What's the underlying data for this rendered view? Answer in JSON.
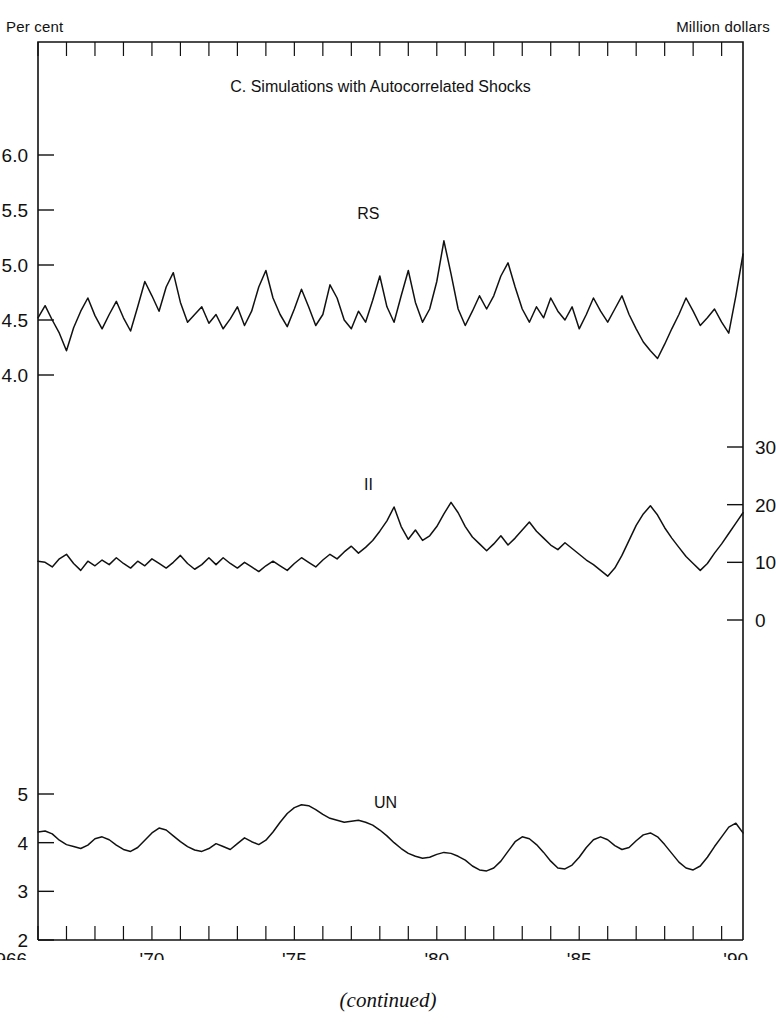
{
  "figure": {
    "left_axis_caption": "Per cent",
    "right_axis_caption": "Million dollars",
    "bottom_caption": "(continued)",
    "title": "C.  Simulations with Autocorrelated Shocks"
  },
  "chart_data": {
    "type": "line",
    "title": "C.  Simulations with Autocorrelated Shocks",
    "xlabel": "",
    "ylabel": "Per cent",
    "ylabel_right": "Million dollars",
    "grid": false,
    "legend_position": "inline-annotations",
    "xlim": [
      1966,
      1990.75
    ],
    "x_tick_labels": [
      "1966",
      "'70",
      "'75",
      "'80",
      "'85",
      "'90"
    ],
    "x_tick_values": [
      1966,
      1970,
      1975,
      1980,
      1985,
      1990
    ],
    "x_minor_tick_interval": 1,
    "line_color": "#111111",
    "frame_color": "#111111",
    "panels": [
      {
        "name": "RS",
        "label": "RS",
        "axis": "left",
        "units": "Per cent",
        "y_tick_labels": [
          "6.0",
          "5.5",
          "5.0",
          "4.5",
          "4.0"
        ],
        "y_tick_values": [
          6.0,
          5.5,
          5.0,
          4.5,
          4.0
        ],
        "ylim": [
          3.85,
          6.55
        ],
        "label_x": 1977.6,
        "label_y": 5.42,
        "x": [
          1966.0,
          1966.25,
          1966.5,
          1966.75,
          1967.0,
          1967.25,
          1967.5,
          1967.75,
          1968.0,
          1968.25,
          1968.5,
          1968.75,
          1969.0,
          1969.25,
          1969.5,
          1969.75,
          1970.0,
          1970.25,
          1970.5,
          1970.75,
          1971.0,
          1971.25,
          1971.5,
          1971.75,
          1972.0,
          1972.25,
          1972.5,
          1972.75,
          1973.0,
          1973.25,
          1973.5,
          1973.75,
          1974.0,
          1974.25,
          1974.5,
          1974.75,
          1975.0,
          1975.25,
          1975.5,
          1975.75,
          1976.0,
          1976.25,
          1976.5,
          1976.75,
          1977.0,
          1977.25,
          1977.5,
          1977.75,
          1978.0,
          1978.25,
          1978.5,
          1978.75,
          1979.0,
          1979.25,
          1979.5,
          1979.75,
          1980.0,
          1980.25,
          1980.5,
          1980.75,
          1981.0,
          1981.25,
          1981.5,
          1981.75,
          1982.0,
          1982.25,
          1982.5,
          1982.75,
          1983.0,
          1983.25,
          1983.5,
          1983.75,
          1984.0,
          1984.25,
          1984.5,
          1984.75,
          1985.0,
          1985.25,
          1985.5,
          1985.75,
          1986.0,
          1986.25,
          1986.5,
          1986.75,
          1987.0,
          1987.25,
          1987.5,
          1987.75,
          1988.0,
          1988.25,
          1988.5,
          1988.75,
          1989.0,
          1989.25,
          1989.5,
          1989.75,
          1990.0,
          1990.25,
          1990.5,
          1990.75
        ],
        "y": [
          4.52,
          4.63,
          4.5,
          4.38,
          4.22,
          4.43,
          4.58,
          4.7,
          4.54,
          4.42,
          4.55,
          4.67,
          4.52,
          4.4,
          4.62,
          4.85,
          4.72,
          4.58,
          4.8,
          4.93,
          4.66,
          4.48,
          4.55,
          4.62,
          4.47,
          4.55,
          4.42,
          4.51,
          4.62,
          4.45,
          4.58,
          4.8,
          4.95,
          4.7,
          4.55,
          4.44,
          4.6,
          4.78,
          4.62,
          4.45,
          4.55,
          4.82,
          4.7,
          4.5,
          4.42,
          4.58,
          4.48,
          4.68,
          4.9,
          4.62,
          4.48,
          4.72,
          4.95,
          4.66,
          4.48,
          4.6,
          4.85,
          5.22,
          4.92,
          4.6,
          4.45,
          4.58,
          4.72,
          4.6,
          4.72,
          4.9,
          5.02,
          4.8,
          4.6,
          4.48,
          4.62,
          4.52,
          4.7,
          4.58,
          4.5,
          4.62,
          4.42,
          4.55,
          4.7,
          4.58,
          4.48,
          4.6,
          4.72,
          4.55,
          4.42,
          4.3,
          4.22,
          4.15,
          4.28,
          4.42,
          4.55,
          4.7,
          4.58,
          4.45,
          4.52,
          4.6,
          4.48,
          4.38,
          4.72,
          5.1
        ]
      },
      {
        "name": "II",
        "label": "II",
        "axis": "right",
        "units": "Million dollars",
        "y_tick_labels": [
          "30",
          "20",
          "10",
          "0"
        ],
        "y_tick_values": [
          30,
          20,
          10,
          0
        ],
        "ylim": [
          -2,
          35
        ],
        "label_x": 1977.6,
        "label_y": 22.5,
        "x": [
          1966.0,
          1966.25,
          1966.5,
          1966.75,
          1967.0,
          1967.25,
          1967.5,
          1967.75,
          1968.0,
          1968.25,
          1968.5,
          1968.75,
          1969.0,
          1969.25,
          1969.5,
          1969.75,
          1970.0,
          1970.25,
          1970.5,
          1970.75,
          1971.0,
          1971.25,
          1971.5,
          1971.75,
          1972.0,
          1972.25,
          1972.5,
          1972.75,
          1973.0,
          1973.25,
          1973.5,
          1973.75,
          1974.0,
          1974.25,
          1974.5,
          1974.75,
          1975.0,
          1975.25,
          1975.5,
          1975.75,
          1976.0,
          1976.25,
          1976.5,
          1976.75,
          1977.0,
          1977.25,
          1977.5,
          1977.75,
          1978.0,
          1978.25,
          1978.5,
          1978.75,
          1979.0,
          1979.25,
          1979.5,
          1979.75,
          1980.0,
          1980.25,
          1980.5,
          1980.75,
          1981.0,
          1981.25,
          1981.5,
          1981.75,
          1982.0,
          1982.25,
          1982.5,
          1982.75,
          1983.0,
          1983.25,
          1983.5,
          1983.75,
          1984.0,
          1984.25,
          1984.5,
          1984.75,
          1985.0,
          1985.25,
          1985.5,
          1985.75,
          1986.0,
          1986.25,
          1986.5,
          1986.75,
          1987.0,
          1987.25,
          1987.5,
          1987.75,
          1988.0,
          1988.25,
          1988.5,
          1988.75,
          1989.0,
          1989.25,
          1989.5,
          1989.75,
          1990.0,
          1990.25,
          1990.5,
          1990.75
        ],
        "y": [
          10.2,
          10.0,
          9.2,
          10.6,
          11.4,
          9.8,
          8.6,
          10.2,
          9.4,
          10.4,
          9.6,
          10.8,
          9.8,
          9.0,
          10.2,
          9.4,
          10.6,
          9.8,
          9.0,
          10.0,
          11.2,
          9.8,
          8.8,
          9.6,
          10.8,
          9.6,
          10.8,
          9.8,
          9.0,
          10.0,
          9.2,
          8.4,
          9.4,
          10.2,
          9.4,
          8.6,
          9.8,
          10.8,
          10.0,
          9.2,
          10.4,
          11.4,
          10.6,
          11.8,
          12.8,
          11.6,
          12.6,
          13.8,
          15.4,
          17.2,
          19.6,
          16.2,
          14.0,
          15.6,
          13.8,
          14.6,
          16.2,
          18.4,
          20.4,
          18.6,
          16.2,
          14.4,
          13.2,
          12.0,
          13.2,
          14.6,
          13.0,
          14.2,
          15.6,
          17.0,
          15.4,
          14.2,
          13.0,
          12.2,
          13.4,
          12.4,
          11.4,
          10.4,
          9.6,
          8.6,
          7.6,
          9.0,
          11.2,
          13.8,
          16.4,
          18.4,
          19.8,
          18.2,
          16.0,
          14.2,
          12.6,
          11.0,
          9.8,
          8.6,
          9.8,
          11.6,
          13.2,
          15.0,
          16.8,
          18.6
        ]
      },
      {
        "name": "UN",
        "label": "UN",
        "axis": "left",
        "units": "Per cent",
        "y_tick_labels": [
          "5",
          "4",
          "3",
          "2"
        ],
        "y_tick_values": [
          5,
          4,
          3,
          2
        ],
        "ylim": [
          2.0,
          5.6
        ],
        "label_x": 1978.2,
        "label_y": 4.72,
        "x": [
          1966.0,
          1966.25,
          1966.5,
          1966.75,
          1967.0,
          1967.25,
          1967.5,
          1967.75,
          1968.0,
          1968.25,
          1968.5,
          1968.75,
          1969.0,
          1969.25,
          1969.5,
          1969.75,
          1970.0,
          1970.25,
          1970.5,
          1970.75,
          1971.0,
          1971.25,
          1971.5,
          1971.75,
          1972.0,
          1972.25,
          1972.5,
          1972.75,
          1973.0,
          1973.25,
          1973.5,
          1973.75,
          1974.0,
          1974.25,
          1974.5,
          1974.75,
          1975.0,
          1975.25,
          1975.5,
          1975.75,
          1976.0,
          1976.25,
          1976.5,
          1976.75,
          1977.0,
          1977.25,
          1977.5,
          1977.75,
          1978.0,
          1978.25,
          1978.5,
          1978.75,
          1979.0,
          1979.25,
          1979.5,
          1979.75,
          1980.0,
          1980.25,
          1980.5,
          1980.75,
          1981.0,
          1981.25,
          1981.5,
          1981.75,
          1982.0,
          1982.25,
          1982.5,
          1982.75,
          1983.0,
          1983.25,
          1983.5,
          1983.75,
          1984.0,
          1984.25,
          1984.5,
          1984.75,
          1985.0,
          1985.25,
          1985.5,
          1985.75,
          1986.0,
          1986.25,
          1986.5,
          1986.75,
          1987.0,
          1987.25,
          1987.5,
          1987.75,
          1988.0,
          1988.25,
          1988.5,
          1988.75,
          1989.0,
          1989.25,
          1989.5,
          1989.75,
          1990.0,
          1990.25,
          1990.5,
          1990.75
        ],
        "y": [
          4.22,
          4.24,
          4.18,
          4.05,
          3.96,
          3.92,
          3.88,
          3.95,
          4.08,
          4.12,
          4.06,
          3.95,
          3.86,
          3.82,
          3.9,
          4.05,
          4.2,
          4.3,
          4.26,
          4.14,
          4.02,
          3.92,
          3.85,
          3.82,
          3.88,
          3.98,
          3.92,
          3.86,
          3.98,
          4.1,
          4.02,
          3.96,
          4.05,
          4.22,
          4.42,
          4.6,
          4.72,
          4.78,
          4.76,
          4.68,
          4.58,
          4.5,
          4.46,
          4.42,
          4.44,
          4.46,
          4.42,
          4.36,
          4.26,
          4.14,
          4.0,
          3.88,
          3.78,
          3.72,
          3.68,
          3.7,
          3.76,
          3.8,
          3.78,
          3.72,
          3.64,
          3.52,
          3.44,
          3.42,
          3.48,
          3.62,
          3.82,
          4.02,
          4.12,
          4.08,
          3.96,
          3.8,
          3.62,
          3.48,
          3.46,
          3.54,
          3.7,
          3.9,
          4.06,
          4.12,
          4.06,
          3.94,
          3.86,
          3.9,
          4.04,
          4.16,
          4.2,
          4.12,
          3.96,
          3.78,
          3.6,
          3.48,
          3.44,
          3.52,
          3.7,
          3.92,
          4.12,
          4.32,
          4.4,
          4.2,
          3.96,
          3.76
        ]
      }
    ]
  }
}
